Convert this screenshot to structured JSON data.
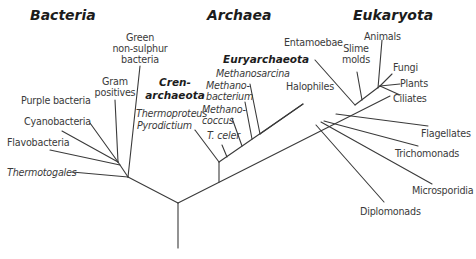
{
  "domains": {
    "bacteria": "Bacteria",
    "archaea": "Archaea",
    "eukaryota": "Eukaryota"
  },
  "subgroups": {
    "crenarchaeota_1": "Cren-",
    "crenarchaeota_2": "archaeota",
    "euryarchaeota": "Euryarchaeota"
  },
  "bacteria_leaves": {
    "green_1": "Green",
    "green_2": "non-sulphur",
    "green_3": "bacteria",
    "gram_1": "Gram",
    "gram_2": "positives",
    "purple": "Purple bacteria",
    "cyano": "Cyanobacteria",
    "flavo": "Flavobacteria",
    "thermotogales": "Thermotogales"
  },
  "archaea_leaves": {
    "thermoproteus": "Thermoproteus",
    "pyrodictium": "Pyrodictium",
    "methanosarcina": "Methanosarcina",
    "methanobacterium_1": "Methano-",
    "methanobacterium_2": "bacterium",
    "methanococcus_1": "Methano-",
    "methanococcus_2": "coccus",
    "tceler": "T. celer",
    "halophiles": "Halophiles"
  },
  "eukaryota_leaves": {
    "entamoebae": "Entamoebae",
    "slime_1": "Slime",
    "slime_2": "molds",
    "animals": "Animals",
    "fungi": "Fungi",
    "plants": "Plants",
    "ciliates": "Ciliates",
    "flagellates": "Flagellates",
    "trichomonads": "Trichomonads",
    "microsporidia": "Microsporidia",
    "diplomonads": "Diplomonads"
  },
  "colors": {
    "line": "#3a3a3a",
    "text": "#3a3a3a",
    "heading": "#1c1c1c"
  }
}
